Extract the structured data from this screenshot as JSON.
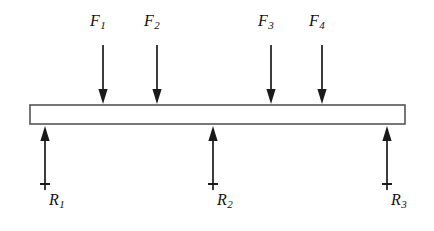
{
  "figure": {
    "kind": "free-body-beam-diagram",
    "background_color": "#ffffff",
    "line_color": "#1a1a1a",
    "beam_fill_color": "#ffffff",
    "beam_stroke_color": "#555555"
  },
  "beam": {
    "name": "beam",
    "x": 30,
    "y": 105,
    "width": 375,
    "height": 19
  },
  "loads": [
    {
      "id": "F1",
      "base": "F",
      "sub": "1",
      "x": 103,
      "label_x": 90,
      "label_y": 13,
      "shaft_top": 45,
      "tip_y": 104
    },
    {
      "id": "F2",
      "base": "F",
      "sub": "2",
      "x": 157,
      "label_x": 144,
      "label_y": 13,
      "shaft_top": 45,
      "tip_y": 104
    },
    {
      "id": "F3",
      "base": "F",
      "sub": "3",
      "x": 271,
      "label_x": 258,
      "label_y": 13,
      "shaft_top": 45,
      "tip_y": 104
    },
    {
      "id": "F4",
      "base": "F",
      "sub": "4",
      "x": 322,
      "label_x": 309,
      "label_y": 13,
      "shaft_top": 45,
      "tip_y": 104
    }
  ],
  "reactions": [
    {
      "id": "R1",
      "base": "R",
      "sub": "1",
      "x": 45,
      "label_x": 49,
      "label_y": 192,
      "tip_y": 126,
      "shaft_bottom": 190,
      "tick_y": 184,
      "tick_half_width": 5
    },
    {
      "id": "R2",
      "base": "R",
      "sub": "2",
      "x": 213,
      "label_x": 217,
      "label_y": 192,
      "tip_y": 126,
      "shaft_bottom": 190,
      "tick_y": 184,
      "tick_half_width": 5
    },
    {
      "id": "R3",
      "base": "R",
      "sub": "3",
      "x": 387,
      "label_x": 391,
      "label_y": 192,
      "tip_y": 126,
      "shaft_bottom": 190,
      "tick_y": 184,
      "tick_half_width": 5
    }
  ]
}
